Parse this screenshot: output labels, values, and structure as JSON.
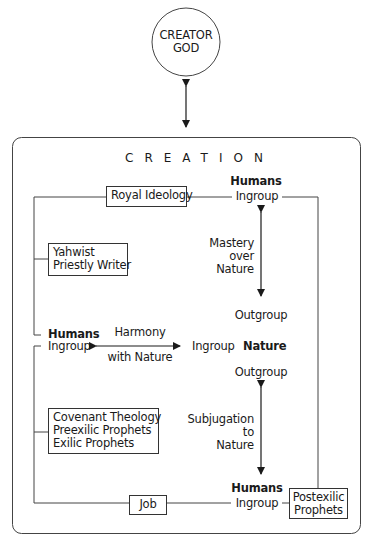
{
  "god": {
    "line1": "CREATOR",
    "line2": "GOD"
  },
  "creation": {
    "title": "CREATION"
  },
  "top_humans": {
    "humans": "Humans",
    "ingroup": "Ingroup"
  },
  "middle": {
    "humans": "Humans",
    "ingroup_left": "Ingroup",
    "harmony_line1": "Harmony",
    "harmony_line2": "with Nature",
    "ingroup_right": "Ingroup",
    "nature": "Nature",
    "outgroup_top": "Outgroup",
    "outgroup_bottom": "Outgroup"
  },
  "bottom_humans": {
    "humans": "Humans",
    "ingroup": "Ingroup"
  },
  "mastery": {
    "line1": "Mastery",
    "line2": "over",
    "line3": "Nature"
  },
  "subjugation": {
    "line1": "Subjugation",
    "line2": "to",
    "line3": "Nature"
  },
  "boxes": {
    "royal": "Royal Ideology",
    "yahwist": {
      "line1": "Yahwist",
      "line2": "Priestly Writer"
    },
    "covenant": {
      "line1": "Covenant Theology",
      "line2": "Preexilic Prophets",
      "line3": "Exilic Prophets"
    },
    "job": "Job",
    "postexilic": {
      "line1": "Postexilic",
      "line2": "Prophets"
    }
  },
  "colors": {
    "line": "#333333",
    "text": "#1a1a1a",
    "background": "#ffffff"
  }
}
